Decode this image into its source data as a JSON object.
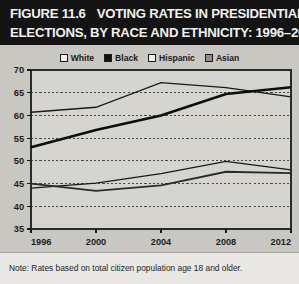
{
  "title": {
    "figure_number": "FIGURE 11.6",
    "line1_rest": "VOTING RATES IN PRESIDENTIAL",
    "line2": "ELECTIONS, BY RACE AND ETHNICITY: 1996–2012"
  },
  "legend": {
    "position": "top-center",
    "items": [
      {
        "label": "White",
        "swatch": "open-square",
        "color": "#f4f3f0"
      },
      {
        "label": "Black",
        "swatch": "filled-black-square",
        "color": "#111111"
      },
      {
        "label": "Hispanic",
        "swatch": "open-square",
        "color": "#efeeea"
      },
      {
        "label": "Asian",
        "swatch": "filled-gray-square",
        "color": "#8e8d89"
      }
    ]
  },
  "note": {
    "text": "Note: Rates based on total citizen population age 18 and older."
  },
  "chart_data": {
    "type": "line",
    "title": "VOTING RATES IN PRESIDENTIAL ELECTIONS, BY RACE AND ETHNICITY: 1996–2012",
    "xlabel": "",
    "ylabel": "",
    "x": [
      1996,
      2000,
      2004,
      2008,
      2012
    ],
    "xtick_labels": [
      "1996",
      "2000",
      "2004",
      "2008",
      "2012"
    ],
    "ytick_labels": [
      "35",
      "40",
      "45",
      "50",
      "55",
      "60",
      "65",
      "70"
    ],
    "yticks": [
      35,
      40,
      45,
      50,
      55,
      60,
      65,
      70
    ],
    "ylim": [
      35,
      70
    ],
    "xlim": [
      1996,
      2012
    ],
    "grid": "horizontal-dashed",
    "legend_position": "above-plot",
    "series": [
      {
        "name": "White",
        "values": [
          60.7,
          61.8,
          67.2,
          66.1,
          64.1
        ],
        "color": "#1a1a1a",
        "width": 1.3
      },
      {
        "name": "Black",
        "values": [
          53.0,
          56.8,
          60.0,
          64.7,
          66.2
        ],
        "color": "#0d0d0d",
        "width": 2.6
      },
      {
        "name": "Hispanic",
        "values": [
          44.0,
          45.1,
          47.2,
          49.9,
          48.0
        ],
        "color": "#1a1a1a",
        "width": 1.3
      },
      {
        "name": "Asian",
        "values": [
          45.0,
          43.4,
          44.6,
          47.6,
          47.3
        ],
        "color": "#2a2a2a",
        "width": 1.9
      }
    ]
  }
}
